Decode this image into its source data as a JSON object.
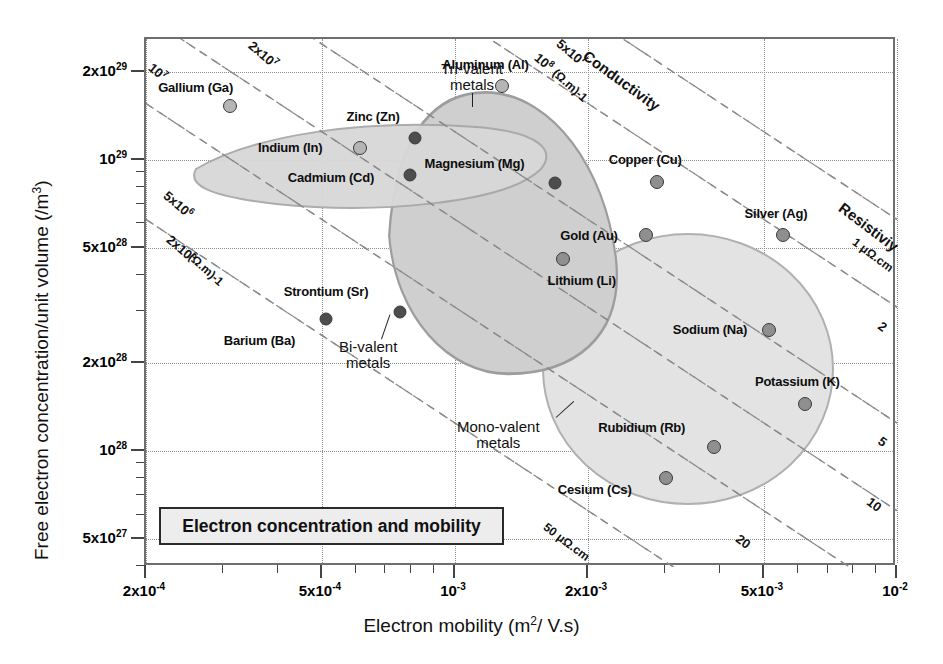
{
  "chart_data": {
    "type": "scatter",
    "title": "Electron concentration and mobility",
    "xlabel_parts": {
      "pre": "Electron mobility (m",
      "sup": "2",
      "post": "/ V.s)"
    },
    "ylabel_parts": {
      "pre": "Free electron concentration/unit volume  (/m",
      "sup": "3",
      "post": ")"
    },
    "xscale": "log",
    "yscale": "log",
    "xlim": [
      0.0002,
      0.01
    ],
    "ylim": [
      4e+27,
      2.6e+29
    ],
    "grid": true,
    "xticks": [
      {
        "value": 0.0002,
        "label": "2x10",
        "exp": "-4"
      },
      {
        "value": 0.0005,
        "label": "5x10",
        "exp": "-4"
      },
      {
        "value": 0.001,
        "label": "10",
        "exp": "-3"
      },
      {
        "value": 0.002,
        "label": "2x10",
        "exp": "-3"
      },
      {
        "value": 0.005,
        "label": "5x10",
        "exp": "-3"
      },
      {
        "value": 0.01,
        "label": "10",
        "exp": "-2"
      }
    ],
    "yticks": [
      {
        "value": 2e+29,
        "label": "2x10",
        "exp": "29"
      },
      {
        "value": 1e+29,
        "label": "10",
        "exp": "29"
      },
      {
        "value": 5e+28,
        "label": "5x10",
        "exp": "28"
      },
      {
        "value": 2e+28,
        "label": "2x10",
        "exp": "28"
      },
      {
        "value": 1e+28,
        "label": "10",
        "exp": "28"
      },
      {
        "value": 5e+27,
        "label": "5x10",
        "exp": "27"
      }
    ],
    "points": [
      {
        "name": "Gallium (Ga)",
        "element": "Ga",
        "x": 0.00031,
        "y": 1.53e+29,
        "shade": "light",
        "label_dx": -72,
        "label_dy": -18
      },
      {
        "name": "Indium (In)",
        "element": "In",
        "x": 0.00061,
        "y": 1.1e+29,
        "shade": "light",
        "label_dx": -102,
        "label_dy": 0
      },
      {
        "name": "Aluminum (Al)",
        "element": "Al",
        "x": 0.00128,
        "y": 1.79e+29,
        "shade": "light",
        "label_dx": -60,
        "label_dy": -21
      },
      {
        "name": "Zinc (Zn)",
        "element": "Zn",
        "x": 0.00081,
        "y": 1.19e+29,
        "shade": "dark",
        "label_dx": -68,
        "label_dy": -21
      },
      {
        "name": "Cadmium (Cd)",
        "element": "Cd",
        "x": 0.00079,
        "y": 8.9e+28,
        "shade": "dark",
        "label_dx": -122,
        "label_dy": 3
      },
      {
        "name": "Magnesium (Mg)",
        "element": "Mg",
        "x": 0.00168,
        "y": 8.3e+28,
        "shade": "dark",
        "label_dx": -130,
        "label_dy": -19
      },
      {
        "name": "Strontium (Sr)",
        "element": "Sr",
        "x": 0.00075,
        "y": 3e+28,
        "shade": "dark",
        "label_dx": -116,
        "label_dy": -20
      },
      {
        "name": "Barium (Ba)",
        "element": "Ba",
        "x": 0.00051,
        "y": 2.85e+28,
        "shade": "dark",
        "label_dx": -102,
        "label_dy": 22
      },
      {
        "name": "Lithium (Li)",
        "element": "Li",
        "x": 0.00176,
        "y": 4.55e+28,
        "shade": "mid",
        "label_dx": -16,
        "label_dy": 22
      },
      {
        "name": "Copper (Cu)",
        "element": "Cu",
        "x": 0.00286,
        "y": 8.4e+28,
        "shade": "mid",
        "label_dx": -48,
        "label_dy": -22
      },
      {
        "name": "Gold (Au)",
        "element": "Au",
        "x": 0.00271,
        "y": 5.5e+28,
        "shade": "mid",
        "label_dx": -86,
        "label_dy": 1
      },
      {
        "name": "Silver (Ag)",
        "element": "Ag",
        "x": 0.00551,
        "y": 5.5e+28,
        "shade": "mid",
        "label_dx": -38,
        "label_dy": -21
      },
      {
        "name": "Sodium (Na)",
        "element": "Na",
        "x": 0.00513,
        "y": 2.6e+28,
        "shade": "mid",
        "label_dx": -96,
        "label_dy": 0
      },
      {
        "name": "Potassium (K)",
        "element": "K",
        "x": 0.00619,
        "y": 1.45e+28,
        "shade": "mid",
        "label_dx": -50,
        "label_dy": -22
      },
      {
        "name": "Rubidium (Rb)",
        "element": "Rb",
        "x": 0.00386,
        "y": 1.03e+28,
        "shade": "mid",
        "label_dx": -116,
        "label_dy": -19
      },
      {
        "name": "Cesium (Cs)",
        "element": "Cs",
        "x": 0.003,
        "y": 8.1e+27,
        "shade": "mid",
        "label_dx": -108,
        "label_dy": 12
      }
    ],
    "groups": [
      {
        "name": "Tri-valent metals",
        "line1": "Tri-valent",
        "line2": "metals"
      },
      {
        "name": "Bi-valent metals",
        "line1": "Bi-valent",
        "line2": "metals"
      },
      {
        "name": "Mono-valent metals",
        "line1": "Mono-valent",
        "line2": "metals"
      }
    ],
    "conductivity": {
      "axis_label": "Conductivity",
      "unit_label": "(Ω.m)-1",
      "lines": [
        "10⁷",
        "2x10⁶",
        "5x10⁶",
        "2x10⁷",
        "5x10⁷",
        "10⁸"
      ],
      "line_labels": [
        {
          "label": "10",
          "exp": "7"
        },
        {
          "label": "2x10",
          "exp": "7"
        },
        {
          "label": "5x10",
          "exp": "7"
        },
        {
          "label": "10",
          "exp": "8"
        },
        {
          "label": "5x10",
          "exp": "6"
        },
        {
          "label": "2x10",
          "exp": "6"
        }
      ]
    },
    "resistivity": {
      "axis_label": "Resistiviy",
      "unit_labels": [
        "1 μΩ.cm",
        "50 μΩ.cm"
      ],
      "lines": [
        "1",
        "2",
        "5",
        "10",
        "20",
        "50"
      ]
    }
  },
  "annotations": {
    "conductivity_title": "Conductivity",
    "conductivity_unit_top": "(Ω.m)-1",
    "conductivity_unit_left": "(Ω.m)-1",
    "resistivity_title": "Resistiviy",
    "resistivity_1": "1 μΩ.cm",
    "resistivity_50": "50 μΩ.cm",
    "r2": "2",
    "r5": "5",
    "r10": "10",
    "r20": "20"
  }
}
